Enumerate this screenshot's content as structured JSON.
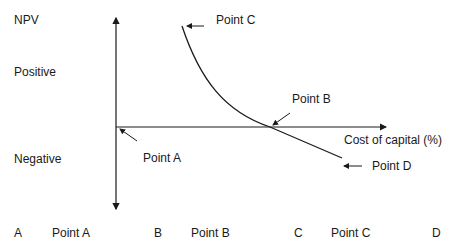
{
  "diagram": {
    "top_cutoff_text": "",
    "y_axis_label": "NPV",
    "positive_label": "Positive",
    "negative_label": "Negative",
    "x_axis_label": "Cost of capital (%)",
    "points": {
      "a": "Point A",
      "b": "Point B",
      "c": "Point C",
      "d": "Point D"
    },
    "colors": {
      "line": "#1a1a1a",
      "background": "#ffffff"
    }
  },
  "options": [
    {
      "letter": "A",
      "label": "Point A"
    },
    {
      "letter": "B",
      "label": "Point B"
    },
    {
      "letter": "C",
      "label": "Point C"
    },
    {
      "letter": "D",
      "label": ""
    }
  ]
}
